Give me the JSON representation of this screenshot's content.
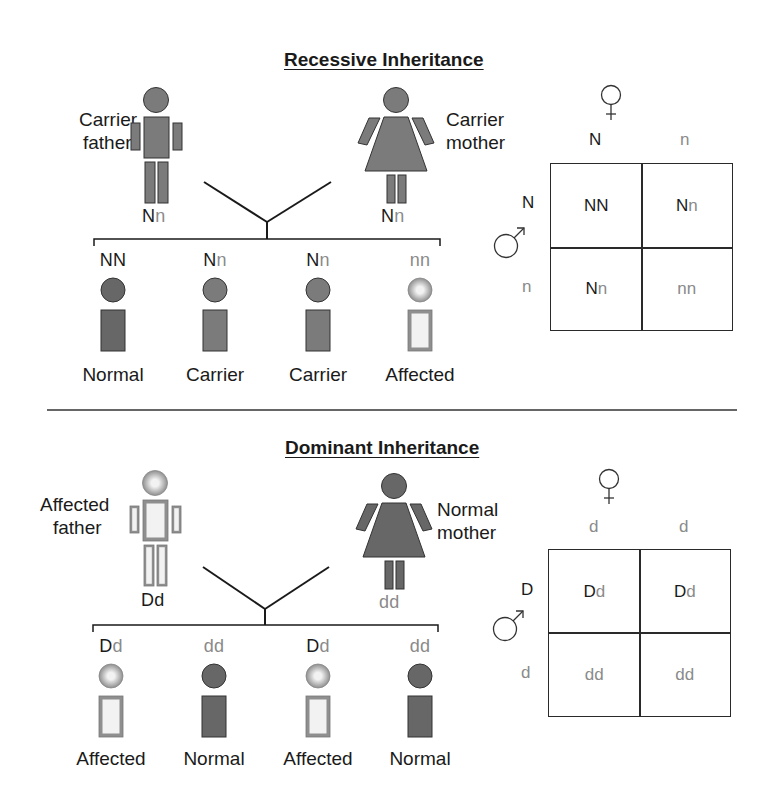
{
  "colors": {
    "normal_fill": "#676767",
    "carrier_fill": "#7b7b7b",
    "affected_edge": "#8f8f8f",
    "affected_center": "#f2f2f2",
    "dominant_allele": "#1a1a1a",
    "recessive_allele": "#8a8a8a"
  },
  "recessive": {
    "title": "Recessive Inheritance",
    "father": {
      "label_line1": "Carrier",
      "label_line2": "father",
      "genotype": [
        {
          "a": "N",
          "type": "dominant"
        },
        {
          "a": "n",
          "type": "recessive"
        }
      ],
      "status": "carrier"
    },
    "mother": {
      "label_line1": "Carrier",
      "label_line2": "mother",
      "genotype": [
        {
          "a": "N",
          "type": "dominant"
        },
        {
          "a": "n",
          "type": "recessive"
        }
      ],
      "status": "carrier"
    },
    "children": [
      {
        "genotype": [
          {
            "a": "N",
            "type": "dominant"
          },
          {
            "a": "N",
            "type": "dominant"
          }
        ],
        "status": "normal",
        "label": "Normal"
      },
      {
        "genotype": [
          {
            "a": "N",
            "type": "dominant"
          },
          {
            "a": "n",
            "type": "recessive"
          }
        ],
        "status": "carrier",
        "label": "Carrier"
      },
      {
        "genotype": [
          {
            "a": "N",
            "type": "dominant"
          },
          {
            "a": "n",
            "type": "recessive"
          }
        ],
        "status": "carrier",
        "label": "Carrier"
      },
      {
        "genotype": [
          {
            "a": "n",
            "type": "recessive"
          },
          {
            "a": "n",
            "type": "recessive"
          }
        ],
        "status": "affected",
        "label": "Affected"
      }
    ],
    "punnett": {
      "female_symbol": "♀",
      "male_symbol": "♂",
      "female_alleles": [
        {
          "a": "N",
          "type": "dominant"
        },
        {
          "a": "n",
          "type": "recessive"
        }
      ],
      "male_alleles": [
        {
          "a": "N",
          "type": "dominant"
        },
        {
          "a": "n",
          "type": "recessive"
        }
      ],
      "cells": [
        [
          [
            {
              "a": "N",
              "type": "dominant"
            },
            {
              "a": "N",
              "type": "dominant"
            }
          ],
          [
            {
              "a": "N",
              "type": "dominant"
            },
            {
              "a": "n",
              "type": "recessive"
            }
          ]
        ],
        [
          [
            {
              "a": "N",
              "type": "dominant"
            },
            {
              "a": "n",
              "type": "recessive"
            }
          ],
          [
            {
              "a": "n",
              "type": "recessive"
            },
            {
              "a": "n",
              "type": "recessive"
            }
          ]
        ]
      ]
    }
  },
  "dominant": {
    "title": "Dominant Inheritance",
    "father": {
      "label_line1": "Affected",
      "label_line2": "father",
      "genotype": [
        {
          "a": "D",
          "type": "dominant"
        },
        {
          "a": "d",
          "type": "dominant"
        }
      ],
      "status": "affected"
    },
    "mother": {
      "label_line1": "Normal",
      "label_line2": "mother",
      "genotype": [
        {
          "a": "d",
          "type": "recessive"
        },
        {
          "a": "d",
          "type": "recessive"
        }
      ],
      "status": "normal"
    },
    "children": [
      {
        "genotype": [
          {
            "a": "D",
            "type": "dominant"
          },
          {
            "a": "d",
            "type": "recessive"
          }
        ],
        "status": "affected",
        "label": "Affected"
      },
      {
        "genotype": [
          {
            "a": "d",
            "type": "recessive"
          },
          {
            "a": "d",
            "type": "recessive"
          }
        ],
        "status": "normal",
        "label": "Normal"
      },
      {
        "genotype": [
          {
            "a": "D",
            "type": "dominant"
          },
          {
            "a": "d",
            "type": "recessive"
          }
        ],
        "status": "affected",
        "label": "Affected"
      },
      {
        "genotype": [
          {
            "a": "d",
            "type": "recessive"
          },
          {
            "a": "d",
            "type": "recessive"
          }
        ],
        "status": "normal",
        "label": "Normal"
      }
    ],
    "punnett": {
      "female_symbol": "♀",
      "male_symbol": "♂",
      "female_alleles": [
        {
          "a": "d",
          "type": "recessive"
        },
        {
          "a": "d",
          "type": "recessive"
        }
      ],
      "male_alleles": [
        {
          "a": "D",
          "type": "dominant"
        },
        {
          "a": "d",
          "type": "recessive"
        }
      ],
      "cells": [
        [
          [
            {
              "a": "D",
              "type": "dominant"
            },
            {
              "a": "d",
              "type": "recessive"
            }
          ],
          [
            {
              "a": "D",
              "type": "dominant"
            },
            {
              "a": "d",
              "type": "recessive"
            }
          ]
        ],
        [
          [
            {
              "a": "d",
              "type": "recessive"
            },
            {
              "a": "d",
              "type": "recessive"
            }
          ],
          [
            {
              "a": "d",
              "type": "recessive"
            },
            {
              "a": "d",
              "type": "recessive"
            }
          ]
        ]
      ]
    }
  }
}
